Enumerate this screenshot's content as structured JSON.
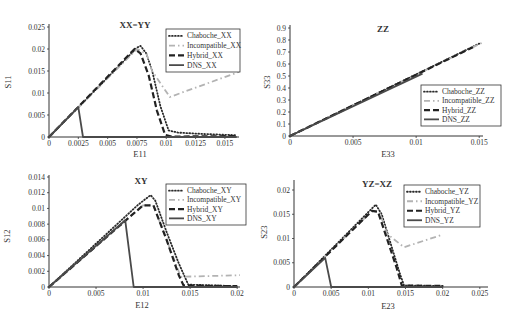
{
  "chart_data": [
    {
      "type": "line",
      "title": "XX=YY",
      "xlabel": "E11",
      "ylabel": "S11",
      "xlim": [
        0,
        0.0162
      ],
      "ylim": [
        0,
        0.025
      ],
      "grid": false,
      "legend_position": "upper right",
      "xticks": [
        0,
        0.0025,
        0.005,
        0.0075,
        0.01,
        0.0125,
        0.015
      ],
      "xtick_labels": [
        "0",
        "0.0025",
        "0.005",
        "0.0075",
        "0.01",
        "0.0125",
        "0.015"
      ],
      "yticks": [
        0,
        0.005,
        0.01,
        0.015,
        0.02,
        0.025
      ],
      "ytick_labels": [
        "0",
        "0.005",
        "0.01",
        "0.015",
        "0.02",
        "0.025"
      ],
      "series": [
        {
          "name": "Chaboche_XX",
          "style": "dotted",
          "color": "#2a2a2a",
          "points": [
            [
              0,
              0
            ],
            [
              0.0075,
              0.0203
            ],
            [
              0.0078,
              0.0207
            ],
            [
              0.0083,
              0.019
            ],
            [
              0.0088,
              0.015
            ],
            [
              0.0095,
              0.007
            ],
            [
              0.0102,
              0.0015
            ],
            [
              0.011,
              0.001
            ],
            [
              0.013,
              0.0007
            ],
            [
              0.016,
              0.0004
            ]
          ]
        },
        {
          "name": "Incompatible_XX",
          "style": "dash-dot",
          "color": "#b3b3b3",
          "points": [
            [
              0,
              0
            ],
            [
              0.0075,
              0.02
            ],
            [
              0.0083,
              0.019
            ],
            [
              0.0088,
              0.015
            ],
            [
              0.0103,
              0.0091
            ],
            [
              0.0162,
              0.0148
            ]
          ]
        },
        {
          "name": "Hybrid_XX",
          "style": "dashed",
          "color": "#222222",
          "points": [
            [
              0,
              0
            ],
            [
              0.0073,
              0.02
            ],
            [
              0.0078,
              0.019
            ],
            [
              0.0085,
              0.014
            ],
            [
              0.0092,
              0.006
            ],
            [
              0.0099,
              0.0005
            ],
            [
              0.0105,
              0.0001
            ],
            [
              0.016,
              0.0002
            ]
          ]
        },
        {
          "name": "DNS_XX",
          "style": "solid",
          "color": "#4a4a4a",
          "points": [
            [
              0,
              0
            ],
            [
              0.0025,
              0.0068
            ],
            [
              0.0029,
              0
            ],
            [
              0.016,
              0
            ]
          ]
        }
      ]
    },
    {
      "type": "line",
      "title": "ZZ",
      "xlabel": "E33",
      "ylabel": "S33",
      "xlim": [
        0,
        0.0153
      ],
      "ylim": [
        0,
        0.9
      ],
      "grid": false,
      "legend_position": "lower right",
      "xticks": [
        0,
        0.005,
        0.01,
        0.015
      ],
      "xtick_labels": [
        "0",
        "0.005",
        "0.01",
        "0.015"
      ],
      "yticks": [
        0,
        0.1,
        0.2,
        0.3,
        0.4,
        0.5,
        0.6,
        0.7,
        0.8,
        0.9
      ],
      "ytick_labels": [
        "0",
        "0.1",
        "0.2",
        "0.3",
        "0.4",
        "0.5",
        "0.6",
        "0.7",
        "0.8",
        "0.9"
      ],
      "series": [
        {
          "name": "Chaboche_ZZ",
          "style": "dotted",
          "color": "#2a2a2a",
          "points": [
            [
              0,
              0
            ],
            [
              0.015,
              0.77
            ]
          ]
        },
        {
          "name": "Incompatible_ZZ",
          "style": "dash-dot",
          "color": "#b3b3b3",
          "points": [
            [
              0,
              0
            ],
            [
              0.0152,
              0.775
            ]
          ]
        },
        {
          "name": "Hybrid_ZZ",
          "style": "dashed",
          "color": "#222222",
          "points": [
            [
              0,
              0
            ],
            [
              0.0145,
              0.74
            ]
          ]
        },
        {
          "name": "DNS_ZZ",
          "style": "solid",
          "color": "#4a4a4a",
          "points": [
            [
              0,
              0
            ],
            [
              0.0105,
              0.52
            ]
          ]
        }
      ]
    },
    {
      "type": "line",
      "title": "XY",
      "xlabel": "E12",
      "ylabel": "S12",
      "xlim": [
        0,
        0.0203
      ],
      "ylim": [
        0,
        0.014
      ],
      "grid": false,
      "legend_position": "upper right",
      "xticks": [
        0,
        0.005,
        0.01,
        0.015,
        0.02
      ],
      "xtick_labels": [
        "0",
        "0.005",
        "0.01",
        "0.015",
        "0.02"
      ],
      "yticks": [
        0,
        0.002,
        0.004,
        0.006,
        0.008,
        0.01,
        0.012,
        0.014
      ],
      "ytick_labels": [
        "0",
        "0.002",
        "0.004",
        "0.006",
        "0.008",
        "0.01",
        "0.012",
        "0.014"
      ],
      "series": [
        {
          "name": "Chaboche_XY",
          "style": "dotted",
          "color": "#2a2a2a",
          "points": [
            [
              0,
              0
            ],
            [
              0.0095,
              0.0105
            ],
            [
              0.0108,
              0.0117
            ],
            [
              0.0113,
              0.011
            ],
            [
              0.0125,
              0.007
            ],
            [
              0.0138,
              0.003
            ],
            [
              0.0148,
              0.0003
            ],
            [
              0.02,
              0.0001
            ]
          ]
        },
        {
          "name": "Incompatible_XY",
          "style": "dash-dot",
          "color": "#b3b3b3",
          "points": [
            [
              0,
              0
            ],
            [
              0.01,
              0.0104
            ],
            [
              0.0111,
              0.0104
            ],
            [
              0.0125,
              0.006
            ],
            [
              0.014,
              0.0013
            ],
            [
              0.0203,
              0.0015
            ]
          ]
        },
        {
          "name": "Hybrid_XY",
          "style": "dashed",
          "color": "#222222",
          "points": [
            [
              0,
              0
            ],
            [
              0.01,
              0.0104
            ],
            [
              0.0111,
              0.0104
            ],
            [
              0.0125,
              0.006
            ],
            [
              0.0138,
              0.0015
            ],
            [
              0.0143,
              0.0002
            ],
            [
              0.02,
              0.0001
            ]
          ]
        },
        {
          "name": "DNS_XY",
          "style": "solid",
          "color": "#4a4a4a",
          "points": [
            [
              0,
              0
            ],
            [
              0.0081,
              0.0085
            ],
            [
              0.009,
              0
            ],
            [
              0.02,
              0
            ]
          ]
        }
      ]
    },
    {
      "type": "line",
      "title": "YZ=XZ",
      "xlabel": "E23",
      "ylabel": "S23",
      "xlim": [
        0,
        0.0261
      ],
      "ylim": [
        0,
        0.02
      ],
      "grid": false,
      "legend_position": "upper right",
      "xticks": [
        0,
        0.005,
        0.01,
        0.015,
        0.02,
        0.025
      ],
      "xtick_labels": [
        "0",
        "0.005",
        "0.01",
        "0.015",
        "0.02",
        "0.025"
      ],
      "yticks": [
        0,
        0.005,
        0.01,
        0.015,
        0.02
      ],
      "ytick_labels": [
        "0",
        "0.005",
        "0.01",
        "0.015",
        "0.02"
      ],
      "series": [
        {
          "name": "Chaboche_YZ",
          "style": "dotted",
          "color": "#2a2a2a",
          "points": [
            [
              0,
              0
            ],
            [
              0.011,
              0.017
            ],
            [
              0.0118,
              0.015
            ],
            [
              0.013,
              0.009
            ],
            [
              0.0142,
              0.003
            ],
            [
              0.0148,
              0.0003
            ],
            [
              0.02,
              0.0002
            ]
          ]
        },
        {
          "name": "Incompatible_YZ",
          "style": "dash-dot",
          "color": "#b3b3b3",
          "points": [
            [
              0,
              0
            ],
            [
              0.0105,
              0.0157
            ],
            [
              0.0115,
              0.0155
            ],
            [
              0.0125,
              0.011
            ],
            [
              0.0148,
              0.0082
            ],
            [
              0.02,
              0.0108
            ]
          ]
        },
        {
          "name": "Hybrid_YZ",
          "style": "dashed",
          "color": "#222222",
          "points": [
            [
              0,
              0
            ],
            [
              0.0105,
              0.0157
            ],
            [
              0.0113,
              0.0155
            ],
            [
              0.0125,
              0.01
            ],
            [
              0.0138,
              0.004
            ],
            [
              0.0145,
              0.0003
            ],
            [
              0.02,
              0.0002
            ]
          ]
        },
        {
          "name": "DNS_YZ",
          "style": "solid",
          "color": "#4a4a4a",
          "points": [
            [
              0,
              0
            ],
            [
              0.0042,
              0.006
            ],
            [
              0.005,
              0
            ],
            [
              0.02,
              0
            ]
          ]
        }
      ]
    }
  ]
}
